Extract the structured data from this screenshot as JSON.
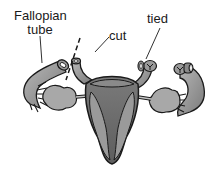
{
  "diagram": {
    "labels": {
      "fallopian_tube": [
        "Fallopian",
        "tube"
      ],
      "cut": "cut",
      "tied": "tied"
    },
    "colors": {
      "outline": "#1a1a1a",
      "tube_fill": "#8c8c8c",
      "tube_highlight": "#b5b5b5",
      "ovary_fill": "#a8a8a8",
      "uterus_outer": "#6e6e6e",
      "uterus_inner": "#9a9a9a",
      "uterus_cavity": "#5a5a5a",
      "background": "#ffffff"
    }
  }
}
